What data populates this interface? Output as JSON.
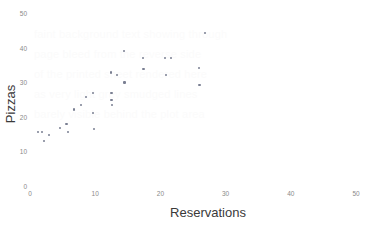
{
  "chart": {
    "type": "scatter",
    "title": "",
    "xlabel": "Reservations",
    "ylabel": "Pizzas",
    "point_color": "#7a7f92",
    "tick_color": "#8a8a8a",
    "label_color": "#3a3a3a",
    "background": "#ffffff"
  },
  "watermark": {
    "line1": "faint background text showing through",
    "line2": "page bleed from the reverse side",
    "line3": "of the printed sheet rendered here",
    "line4": "as very light grey smudged lines",
    "line5": "barely visible behind the plot area"
  },
  "chart_data": {
    "type": "scatter",
    "title": "",
    "xlabel": "Reservations",
    "ylabel": "Pizzas",
    "xlim": [
      0,
      50
    ],
    "ylim": [
      0,
      50
    ],
    "xticks": [
      0,
      10,
      20,
      30,
      40,
      50
    ],
    "yticks": [
      0,
      10,
      20,
      30,
      40,
      50
    ],
    "xtick_labels": [
      "0",
      "10",
      "20",
      "30",
      "40",
      "50"
    ],
    "ytick_labels": [
      "0",
      "10",
      "20",
      "30",
      "40",
      "50"
    ],
    "grid": false,
    "legend": false,
    "series": [
      {
        "name": "Pizzas vs Reservations",
        "color": "#7a7f92",
        "marker": "dot",
        "points": [
          {
            "x": 1.2,
            "y": 15.8
          },
          {
            "x": 1.9,
            "y": 15.9
          },
          {
            "x": 2.1,
            "y": 13.2
          },
          {
            "x": 2.9,
            "y": 15.0
          },
          {
            "x": 4.6,
            "y": 17.1
          },
          {
            "x": 5.6,
            "y": 18.2
          },
          {
            "x": 5.8,
            "y": 16.0
          },
          {
            "x": 6.8,
            "y": 22.4
          },
          {
            "x": 7.8,
            "y": 23.6
          },
          {
            "x": 8.6,
            "y": 26.0
          },
          {
            "x": 9.7,
            "y": 27.1
          },
          {
            "x": 9.7,
            "y": 21.5
          },
          {
            "x": 9.8,
            "y": 16.8
          },
          {
            "x": 12.4,
            "y": 33.1
          },
          {
            "x": 12.5,
            "y": 27.2
          },
          {
            "x": 12.5,
            "y": 25.2
          },
          {
            "x": 12.6,
            "y": 23.6
          },
          {
            "x": 13.4,
            "y": 32.3
          },
          {
            "x": 14.4,
            "y": 39.3
          },
          {
            "x": 14.5,
            "y": 30.2
          },
          {
            "x": 17.3,
            "y": 37.3
          },
          {
            "x": 17.4,
            "y": 34.2
          },
          {
            "x": 20.7,
            "y": 37.3
          },
          {
            "x": 20.8,
            "y": 32.3
          },
          {
            "x": 21.6,
            "y": 37.3
          },
          {
            "x": 25.9,
            "y": 34.3
          },
          {
            "x": 26.0,
            "y": 29.5
          },
          {
            "x": 26.8,
            "y": 44.4
          }
        ]
      }
    ]
  }
}
